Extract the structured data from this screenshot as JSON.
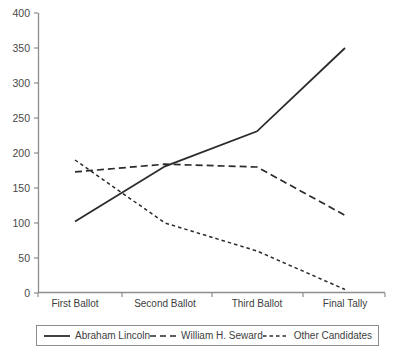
{
  "chart_data": {
    "type": "line",
    "title": "",
    "subtitle": "",
    "xlabel": "",
    "ylabel": "",
    "categories": [
      "First Ballot",
      "Second Ballot",
      "Third Ballot",
      "Final Tally"
    ],
    "ylim": [
      0,
      400
    ],
    "yticks": [
      0,
      50,
      100,
      150,
      200,
      250,
      300,
      350,
      400
    ],
    "ytick_labels": [
      "0",
      "50",
      "100",
      "150",
      "200",
      "250",
      "300",
      "350",
      "400"
    ],
    "grid": false,
    "legend_position": "bottom",
    "series": [
      {
        "name": "Abraham Lincoln",
        "values": [
          102,
          181,
          231,
          350
        ],
        "style": "solid",
        "color": "#2b2b2b"
      },
      {
        "name": "William H. Seward",
        "values": [
          173,
          184,
          180,
          111
        ],
        "style": "dashed",
        "color": "#2b2b2b"
      },
      {
        "name": "Other Candidates",
        "values": [
          190,
          100,
          60,
          5
        ],
        "style": "dotted",
        "color": "#2b2b2b"
      }
    ]
  },
  "axis": {
    "ytick_labels": [
      "400",
      "350",
      "300",
      "250",
      "200",
      "150",
      "100",
      "50",
      "0"
    ],
    "xtick_labels": [
      "First Ballot",
      "Second Ballot",
      "Third Ballot",
      "Final Tally"
    ]
  },
  "legend": {
    "items": [
      {
        "label": "Abraham Lincoln",
        "style": "solid"
      },
      {
        "label": "William H. Seward",
        "style": "dashed"
      },
      {
        "label": "Other Candidates",
        "style": "dotted"
      }
    ]
  },
  "colors": {
    "axis": "#8d8d8d",
    "line": "#2b2b2b",
    "text": "#3d3d3d",
    "background": "#ffffff"
  }
}
